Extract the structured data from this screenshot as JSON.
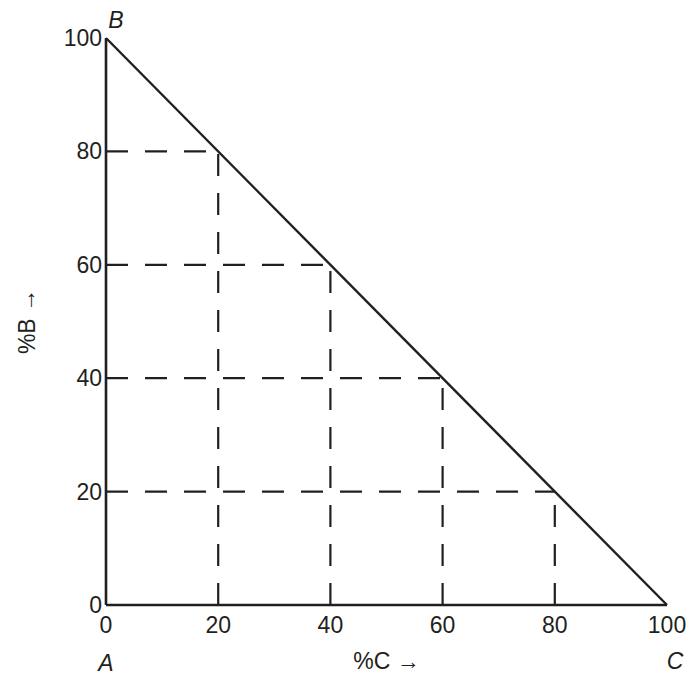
{
  "chart_data": {
    "type": "line",
    "title": "",
    "xlabel": "%C →",
    "ylabel": "%B →",
    "xlim": [
      0,
      100
    ],
    "ylim": [
      0,
      100
    ],
    "x_ticks": [
      "0",
      "20",
      "40",
      "60",
      "80",
      "100"
    ],
    "y_ticks": [
      "0",
      "20",
      "40",
      "60",
      "80",
      "100"
    ],
    "vertices": {
      "A": {
        "label": "A",
        "x": 0,
        "y": 0
      },
      "B": {
        "label": "B",
        "x": 0,
        "y": 100
      },
      "C": {
        "label": "C",
        "x": 100,
        "y": 0
      }
    },
    "series": [
      {
        "name": "B-C line",
        "x": [
          0,
          100
        ],
        "y": [
          100,
          0
        ]
      }
    ],
    "dashed_guides": [
      {
        "x": 20,
        "y": 80
      },
      {
        "x": 40,
        "y": 60
      },
      {
        "x": 60,
        "y": 40
      },
      {
        "x": 80,
        "y": 20
      }
    ],
    "grid": false,
    "legend": "none"
  }
}
